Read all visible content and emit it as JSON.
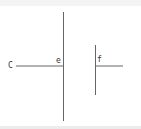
{
  "header": {
    "text": ""
  },
  "diagram": {
    "labels": {
      "c": "C",
      "e": "e",
      "f": "f"
    },
    "line_color": "#555555"
  }
}
